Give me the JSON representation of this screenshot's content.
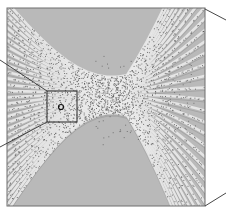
{
  "figure": {
    "colors": {
      "background": "#ffffff",
      "image_base": "#b9b9b9",
      "stripe_light": "#ececec",
      "stripe_dark": "#8f8f8f",
      "dot": "#555555",
      "frame": "#6e6e6e",
      "connector": "#333333"
    },
    "image_frame": {
      "x": 7,
      "y": 8,
      "width": 198,
      "height": 198
    },
    "inset_box": {
      "x": 47,
      "y": 91,
      "width": 30,
      "height": 31
    },
    "defect_marker": {
      "cx": 61,
      "cy": 107,
      "r": 2.5
    },
    "connectors": [
      {
        "x1": 47,
        "y1": 91,
        "x2": 0,
        "y2": 60
      },
      {
        "x1": 47,
        "y1": 122,
        "x2": 0,
        "y2": 147
      },
      {
        "x1": 205,
        "y1": 9,
        "x2": 226,
        "y2": 20
      },
      {
        "x1": 205,
        "y1": 206,
        "x2": 226,
        "y2": 193
      }
    ]
  }
}
